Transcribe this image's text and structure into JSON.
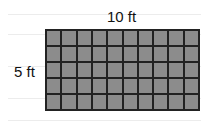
{
  "diagram": {
    "width_label": "10 ft",
    "height_label": "5 ft",
    "columns": 10,
    "rows": 5,
    "cell_color": "#8c8c8c",
    "line_color": "#222222"
  }
}
